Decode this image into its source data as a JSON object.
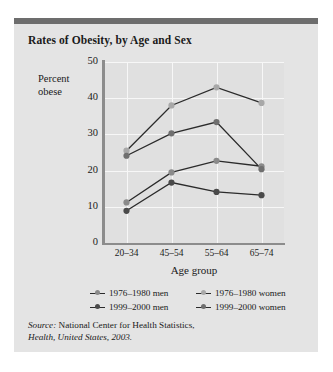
{
  "figure": {
    "title": "Rates of Obesity, by Age and Sex",
    "source_prefix": "Source:",
    "source_text": " National Center for Health Statistics,",
    "source_italic": "Health, United States, 2003."
  },
  "chart_data": {
    "type": "line",
    "title": "Rates of Obesity, by Age and Sex",
    "xlabel": "Age group",
    "ylabel": "Percent obese",
    "ylabel_line1": "Percent",
    "ylabel_line2": "obese",
    "categories": [
      "20–34",
      "45–54",
      "55–64",
      "65–74"
    ],
    "ylim": [
      0,
      50
    ],
    "yticks": [
      0,
      10,
      20,
      30,
      40,
      50
    ],
    "ytick_labels": [
      "0",
      "10",
      "20",
      "30",
      "40",
      "50"
    ],
    "grid": true,
    "legend_position": "bottom",
    "series": [
      {
        "name": "1976–1980 men",
        "color": "#8a8a8a",
        "values": [
          11.2,
          19.5,
          22.7,
          21.2
        ]
      },
      {
        "name": "1976–1980 women",
        "color": "#a8a8a8",
        "values": [
          25.5,
          38.0,
          43.0,
          38.7
        ]
      },
      {
        "name": "1999–2000 men",
        "color": "#4a4a4a",
        "values": [
          8.9,
          16.7,
          14.1,
          13.2
        ]
      },
      {
        "name": "1999–2000 women",
        "color": "#6f6f6f",
        "values": [
          24.1,
          30.3,
          33.4,
          20.4
        ]
      }
    ]
  },
  "colors": {
    "panel_background": "#e4e4e4",
    "plot_background": "#e0e0e0",
    "topbar": "#6d6d6d",
    "axis": "#8c8c8c",
    "gridline": "#f7f7f7",
    "line": "#2b2b2b",
    "text": "#1a1a1a"
  }
}
